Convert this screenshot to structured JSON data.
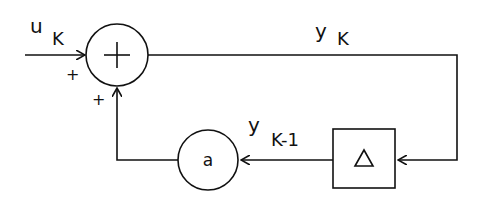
{
  "diagram": {
    "type": "block-diagram",
    "signals": {
      "input": {
        "main": "u",
        "sub": "K"
      },
      "output": {
        "main": "y",
        "sub": "K"
      },
      "delayed": {
        "main": "y",
        "sub": "K-1"
      }
    },
    "blocks": {
      "summer": {
        "symbol": "+",
        "signs": [
          "+",
          "+"
        ]
      },
      "gain": {
        "symbol": "a"
      },
      "delay": {
        "symbol": "Δ"
      }
    },
    "colors": {
      "stroke": "#111111",
      "background": "#ffffff"
    }
  }
}
